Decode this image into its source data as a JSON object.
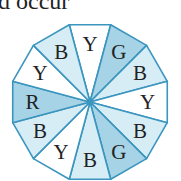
{
  "caption": "d occur",
  "spinner": {
    "center": [
      90,
      102
    ],
    "radius": 80,
    "colors": {
      "white": "#ffffff",
      "light": "#d6edf6",
      "dark": "#a6d3e6",
      "stroke": "#3a95bf"
    },
    "sectors": [
      {
        "label": "Y",
        "shade": "white"
      },
      {
        "label": "G",
        "shade": "dark"
      },
      {
        "label": "B",
        "shade": "light"
      },
      {
        "label": "Y",
        "shade": "white"
      },
      {
        "label": "B",
        "shade": "light"
      },
      {
        "label": "G",
        "shade": "dark"
      },
      {
        "label": "B",
        "shade": "light"
      },
      {
        "label": "Y",
        "shade": "white"
      },
      {
        "label": "B",
        "shade": "light"
      },
      {
        "label": "R",
        "shade": "dark"
      },
      {
        "label": "Y",
        "shade": "white"
      },
      {
        "label": "B",
        "shade": "light"
      }
    ]
  }
}
